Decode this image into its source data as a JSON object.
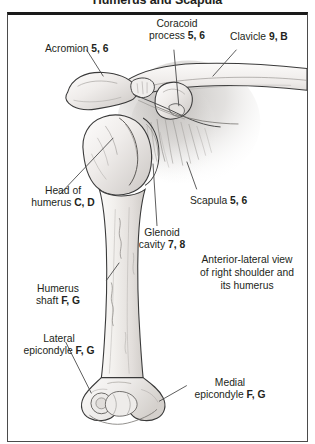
{
  "figure": {
    "title": "Humerus and Scapula",
    "caption_lines": [
      "Anterior-lateral view",
      "of right shoulder and",
      "its humerus"
    ]
  },
  "labels": [
    {
      "id": "acromion",
      "lines": [
        "Acromion "
      ],
      "refs": "5, 6",
      "align": "left"
    },
    {
      "id": "coracoid-process",
      "lines": [
        "Coracoid",
        "process "
      ],
      "refs": "5, 6",
      "align": "center"
    },
    {
      "id": "clavicle",
      "lines": [
        "Clavicle "
      ],
      "refs": "9, B",
      "align": "left"
    },
    {
      "id": "head-of-humerus",
      "lines": [
        "Head of",
        "humerus "
      ],
      "refs": "C, D",
      "align": "center"
    },
    {
      "id": "scapula",
      "lines": [
        "Scapula "
      ],
      "refs": "5, 6",
      "align": "left"
    },
    {
      "id": "glenoid-cavity",
      "lines": [
        "Glenoid",
        "cavity "
      ],
      "refs": "7, 8",
      "align": "center"
    },
    {
      "id": "humerus-shaft",
      "lines": [
        "Humerus",
        "shaft "
      ],
      "refs": "F, G",
      "align": "center"
    },
    {
      "id": "lateral-epicondyle",
      "lines": [
        "Lateral",
        "epicondyle "
      ],
      "refs": "F, G",
      "align": "center"
    },
    {
      "id": "medial-epicondyle",
      "lines": [
        "Medial",
        "epicondyle "
      ],
      "refs": "F, G",
      "align": "center"
    }
  ],
  "label_text": {
    "acromion_l1": "Acromion ",
    "acromion_refs": "5, 6",
    "coracoid_l1": "Coracoid",
    "coracoid_l2": "process ",
    "coracoid_refs": "5, 6",
    "clavicle_l1": "Clavicle ",
    "clavicle_refs": "9, B",
    "head_l1": "Head of",
    "head_l2": "humerus ",
    "head_refs": "C, D",
    "scapula_l1": "Scapula ",
    "scapula_refs": "5, 6",
    "glenoid_l1": "Glenoid",
    "glenoid_l2": "cavity ",
    "glenoid_refs": "7, 8",
    "shaft_l1": "Humerus",
    "shaft_l2": "shaft ",
    "shaft_refs": "F, G",
    "lateral_l1": "Lateral",
    "lateral_l2": "epicondyle ",
    "lateral_refs": "F, G",
    "medial_l1": "Medial",
    "medial_l2": "epicondyle ",
    "medial_refs": "F, G",
    "caption_l1": "Anterior-lateral view",
    "caption_l2": "of right shoulder and",
    "caption_l3": "its humerus"
  },
  "colors": {
    "ink": "#231f20",
    "outline": "#3a3a3a",
    "bone_fill": "#f4f2ef",
    "bone_shade": "#d9d5d0",
    "scapula_shadow": "#c9c6c3",
    "leader": "#4a4a4a",
    "frame": "#4b4b4b",
    "frame_top": "#1a1a1a",
    "background": "#ffffff"
  }
}
